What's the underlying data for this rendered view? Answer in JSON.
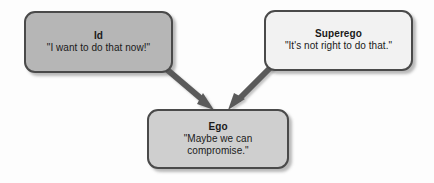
{
  "diagram": {
    "background_color": "#fdfdfd",
    "nodes": [
      {
        "id": "id",
        "title": "Id",
        "quote": "\"I want to do that now!\"",
        "fill_color": "#b6b6b6",
        "border_color": "#4a4a4a"
      },
      {
        "id": "superego",
        "title": "Superego",
        "quote": "\"It's not right to do that.\"",
        "fill_color": "#f2f2f2",
        "border_color": "#4a4a4a"
      },
      {
        "id": "ego",
        "title": "Ego",
        "quote": "\"Maybe we can\ncompromise.\"",
        "fill_color": "#cfcfcf",
        "border_color": "#4a4a4a"
      }
    ],
    "connectors": [
      {
        "id": "id-to-ego",
        "from": "id",
        "to": "ego",
        "color": "#5a5a5a",
        "arrowhead": "filled-triangle"
      },
      {
        "id": "superego-to-ego",
        "from": "superego",
        "to": "ego",
        "color": "#5a5a5a",
        "arrowhead": "filled-triangle"
      }
    ]
  }
}
